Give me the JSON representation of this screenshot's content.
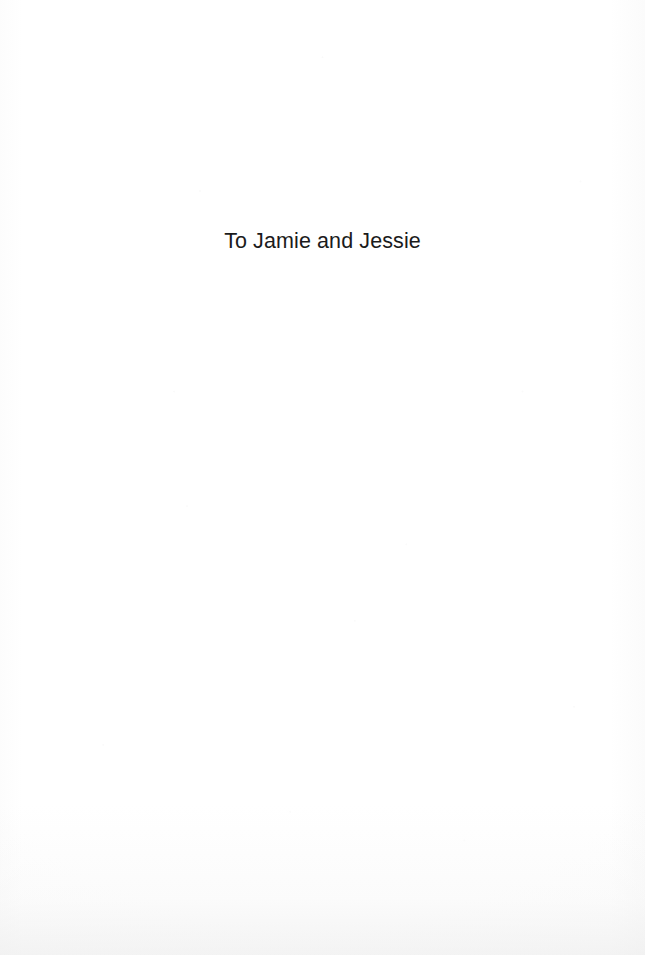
{
  "page": {
    "type": "book-dedication-page",
    "background_color": "#fefefe",
    "text_color": "#1b1b1b"
  },
  "dedication": {
    "text": "To Jamie and Jessie"
  }
}
